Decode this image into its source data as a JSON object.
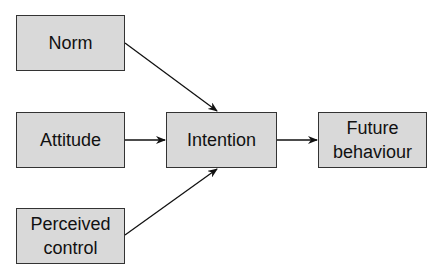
{
  "diagram": {
    "nodes": [
      {
        "id": "norm",
        "label": "Norm"
      },
      {
        "id": "attitude",
        "label": "Attitude"
      },
      {
        "id": "perceived_control",
        "label": "Perceived control",
        "lines": [
          "Perceived",
          "control"
        ]
      },
      {
        "id": "intention",
        "label": "Intention"
      },
      {
        "id": "future_behaviour",
        "label": "Future behaviour",
        "lines": [
          "Future",
          "behaviour"
        ]
      }
    ],
    "edges": [
      {
        "from": "norm",
        "to": "intention"
      },
      {
        "from": "attitude",
        "to": "intention"
      },
      {
        "from": "perceived_control",
        "to": "intention"
      },
      {
        "from": "intention",
        "to": "future_behaviour"
      }
    ],
    "colors": {
      "node_fill": "#d9d9d9",
      "node_border": "#333333",
      "arrow": "#111111"
    }
  }
}
